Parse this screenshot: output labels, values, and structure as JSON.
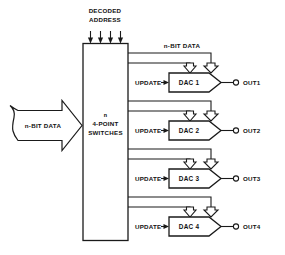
{
  "diagram": {
    "colors": {
      "line": "#1a1a1a",
      "fill": "#ffffff",
      "text": "#111111"
    },
    "top_input": {
      "label_line1": "DECODED",
      "label_line2": "ADDRESS",
      "arrow_count": 4,
      "icon": "down-arrow-icon"
    },
    "left_input": {
      "label": "n-BIT DATA",
      "icon": "right-block-arrow-icon"
    },
    "switch_block": {
      "label_line1": "n",
      "label_line2": "4-POINT",
      "label_line3": "SWITCHES"
    },
    "bus_label": "n-BIT DATA",
    "channels": [
      {
        "dac_label": "DAC 1",
        "update_label": "UPDATE",
        "output_label": "OUT1"
      },
      {
        "dac_label": "DAC 2",
        "update_label": "UPDATE",
        "output_label": "OUT2"
      },
      {
        "dac_label": "DAC 3",
        "update_label": "UPDATE",
        "output_label": "OUT3"
      },
      {
        "dac_label": "DAC 4",
        "update_label": "UPDATE",
        "output_label": "OUT4"
      }
    ]
  }
}
